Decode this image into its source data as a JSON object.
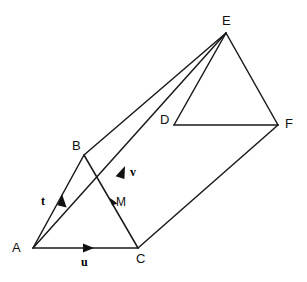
{
  "figure": {
    "type": "geometry-diagram",
    "background_color": "#ffffff",
    "stroke_color": "#1a1a1a"
  },
  "vertices": [
    {
      "id": "A",
      "label": "A",
      "x": 33,
      "y": 248,
      "label_x": 12,
      "label_y": 241
    },
    {
      "id": "B",
      "label": "B",
      "x": 84,
      "y": 155,
      "label_x": 72,
      "label_y": 139
    },
    {
      "id": "C",
      "label": "C",
      "x": 138,
      "y": 248,
      "label_x": 136,
      "label_y": 252
    },
    {
      "id": "D",
      "label": "D",
      "x": 174,
      "y": 125,
      "label_x": 160,
      "label_y": 113
    },
    {
      "id": "E",
      "label": "E",
      "x": 226,
      "y": 33,
      "label_x": 222,
      "label_y": 14
    },
    {
      "id": "F",
      "label": "F",
      "x": 278,
      "y": 125,
      "label_x": 285,
      "label_y": 117
    }
  ],
  "interior_points": [
    {
      "id": "M",
      "label": "M",
      "x": 113,
      "y": 202,
      "label_x": 116,
      "label_y": 196
    }
  ],
  "edges": [
    {
      "id": "edge-AB",
      "from": "A",
      "to": "B"
    },
    {
      "id": "edge-AC",
      "from": "A",
      "to": "C"
    },
    {
      "id": "edge-BC",
      "from": "B",
      "to": "C"
    },
    {
      "id": "edge-BE",
      "from": "B",
      "to": "E"
    },
    {
      "id": "edge-AE",
      "from": "A",
      "to": "E"
    },
    {
      "id": "edge-CF",
      "from": "C",
      "to": "F"
    },
    {
      "id": "edge-DE",
      "from": "D",
      "to": "E"
    },
    {
      "id": "edge-DF",
      "from": "D",
      "to": "F"
    },
    {
      "id": "edge-EF",
      "from": "E",
      "to": "F"
    }
  ],
  "vectors": [
    {
      "id": "vector-t",
      "label": "t",
      "from": "A",
      "toward": "B",
      "arrow_x": 62,
      "arrow_y": 202,
      "label_x": 41,
      "label_y": 195
    },
    {
      "id": "vector-u",
      "label": "u",
      "from": "A",
      "toward": "C",
      "arrow_x": 88,
      "arrow_y": 248,
      "label_x": 81,
      "label_y": 256
    },
    {
      "id": "vector-v",
      "label": "v",
      "from": "A",
      "toward": "E",
      "arrow_x": 123,
      "arrow_y": 172,
      "label_x": 130,
      "label_y": 166
    }
  ],
  "midpoint_marker": {
    "id": "marker-M",
    "x": 113,
    "y": 202
  }
}
